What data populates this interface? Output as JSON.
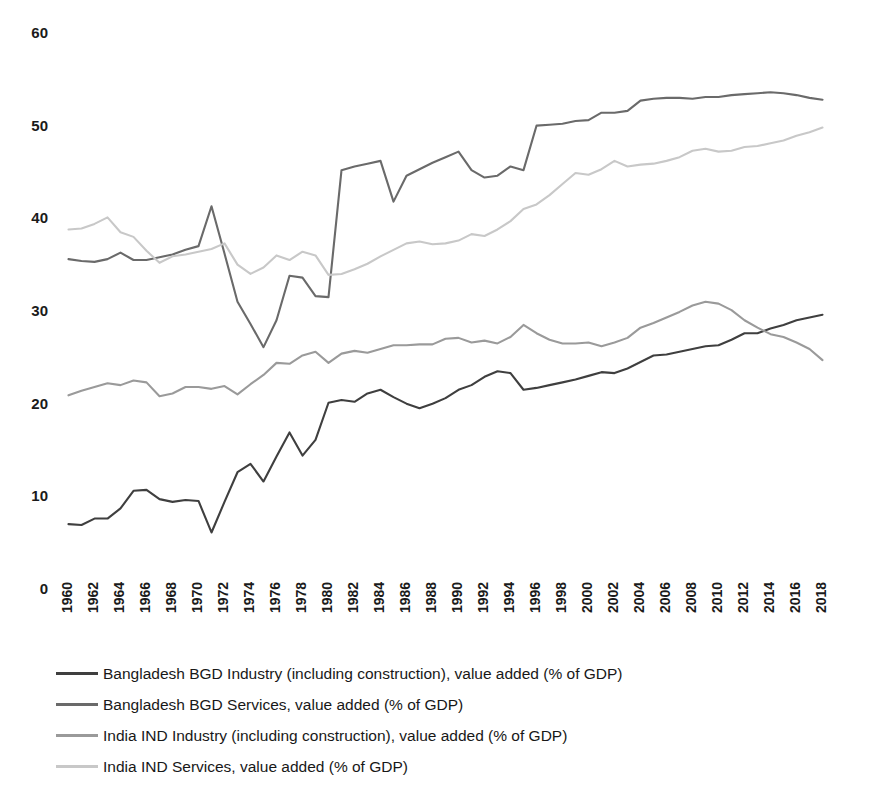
{
  "chart_data": {
    "type": "line",
    "title": "",
    "subtitle": "",
    "xlabel": "",
    "ylabel": "",
    "xlim": [
      1960,
      2018
    ],
    "ylim": [
      0,
      60
    ],
    "ytick_step": 10,
    "xtick_step": 2,
    "grid": false,
    "legend_position": "bottom-left",
    "yticks": [
      "0",
      "10",
      "20",
      "30",
      "40",
      "50",
      "60"
    ],
    "x": [
      1960,
      1961,
      1962,
      1963,
      1964,
      1965,
      1966,
      1967,
      1968,
      1969,
      1970,
      1971,
      1972,
      1973,
      1974,
      1975,
      1976,
      1977,
      1978,
      1979,
      1980,
      1981,
      1982,
      1983,
      1984,
      1985,
      1986,
      1987,
      1988,
      1989,
      1990,
      1991,
      1992,
      1993,
      1994,
      1995,
      1996,
      1997,
      1998,
      1999,
      2000,
      2001,
      2002,
      2003,
      2004,
      2005,
      2006,
      2007,
      2008,
      2009,
      2010,
      2011,
      2012,
      2013,
      2014,
      2015,
      2016,
      2017,
      2018
    ],
    "xticks": [
      "1960",
      "1962",
      "1964",
      "1966",
      "1968",
      "1970",
      "1972",
      "1974",
      "1976",
      "1978",
      "1980",
      "1982",
      "1984",
      "1986",
      "1988",
      "1990",
      "1992",
      "1994",
      "1996",
      "1998",
      "2000",
      "2002",
      "2004",
      "2006",
      "2008",
      "2010",
      "2012",
      "2014",
      "2016",
      "2018"
    ],
    "series": [
      {
        "name": "Bangladesh BGD Industry (including construction), value added (% of GDP)",
        "color": "#3f3f3f",
        "values": [
          7.0,
          6.9,
          7.6,
          7.6,
          8.7,
          10.6,
          10.7,
          9.7,
          9.4,
          9.6,
          9.5,
          6.1,
          9.4,
          12.6,
          13.5,
          11.6,
          14.3,
          16.9,
          14.4,
          16.1,
          20.1,
          20.4,
          20.2,
          21.1,
          21.5,
          20.7,
          20.0,
          19.5,
          20.0,
          20.6,
          21.5,
          22.0,
          22.9,
          23.5,
          23.3,
          21.5,
          21.7,
          22.0,
          22.3,
          22.6,
          23.0,
          23.4,
          23.3,
          23.8,
          24.5,
          25.2,
          25.3,
          25.6,
          25.9,
          26.2,
          26.3,
          26.9,
          27.6,
          27.6,
          28.1,
          28.5,
          29.0,
          29.3,
          29.6
        ]
      },
      {
        "name": "Bangladesh BGD Services, value added (% of GDP)",
        "color": "#6a6a6a",
        "values": [
          35.6,
          35.4,
          35.3,
          35.6,
          36.3,
          35.5,
          35.5,
          35.8,
          36.1,
          36.6,
          37.0,
          41.3,
          36.2,
          31.0,
          28.6,
          26.1,
          29.0,
          33.8,
          33.6,
          31.6,
          31.5,
          45.2,
          45.6,
          45.9,
          46.2,
          41.8,
          44.6,
          45.3,
          46.0,
          46.6,
          47.2,
          45.2,
          44.4,
          44.6,
          45.6,
          45.2,
          50.0,
          50.1,
          50.2,
          50.5,
          50.6,
          51.4,
          51.4,
          51.6,
          52.7,
          52.9,
          53.0,
          53.0,
          52.9,
          53.1,
          53.1,
          53.3,
          53.4,
          53.5,
          53.6,
          53.5,
          53.3,
          53.0,
          52.8
        ]
      },
      {
        "name": "India IND Industry (including construction), value added (% of GDP)",
        "color": "#9a9a9a",
        "values": [
          20.9,
          21.4,
          21.8,
          22.2,
          22.0,
          22.5,
          22.3,
          20.8,
          21.1,
          21.8,
          21.8,
          21.6,
          21.9,
          21.0,
          22.1,
          23.1,
          24.4,
          24.3,
          25.2,
          25.6,
          24.4,
          25.4,
          25.7,
          25.5,
          25.9,
          26.3,
          26.3,
          26.4,
          26.4,
          27.0,
          27.1,
          26.6,
          26.8,
          26.5,
          27.2,
          28.5,
          27.6,
          26.9,
          26.5,
          26.5,
          26.6,
          26.2,
          26.6,
          27.1,
          28.2,
          28.7,
          29.3,
          29.9,
          30.6,
          31.0,
          30.8,
          30.1,
          29.0,
          28.2,
          27.5,
          27.2,
          26.6,
          25.9,
          24.7
        ]
      },
      {
        "name": "India IND Services, value added (% of GDP)",
        "color": "#c8c8c8",
        "values": [
          38.8,
          38.9,
          39.4,
          40.1,
          38.5,
          38.0,
          36.5,
          35.2,
          35.9,
          36.1,
          36.4,
          36.7,
          37.3,
          35.0,
          34.0,
          34.7,
          36.0,
          35.5,
          36.4,
          36.0,
          33.9,
          34.0,
          34.5,
          35.1,
          35.9,
          36.6,
          37.3,
          37.5,
          37.2,
          37.3,
          37.6,
          38.3,
          38.1,
          38.8,
          39.7,
          41.0,
          41.5,
          42.5,
          43.7,
          44.9,
          44.7,
          45.3,
          46.2,
          45.6,
          45.8,
          45.9,
          46.2,
          46.6,
          47.3,
          47.5,
          47.2,
          47.3,
          47.7,
          47.8,
          48.1,
          48.4,
          48.9,
          49.3,
          49.8
        ]
      }
    ]
  },
  "legend": {
    "items": [
      {
        "label": "Bangladesh BGD Industry (including construction), value added (% of GDP)",
        "color": "#3f3f3f"
      },
      {
        "label": "Bangladesh BGD Services, value added (% of GDP)",
        "color": "#6a6a6a"
      },
      {
        "label": "India IND Industry (including construction), value added (% of GDP)",
        "color": "#9a9a9a"
      },
      {
        "label": "India IND Services, value added (% of GDP)",
        "color": "#c8c8c8"
      }
    ]
  }
}
